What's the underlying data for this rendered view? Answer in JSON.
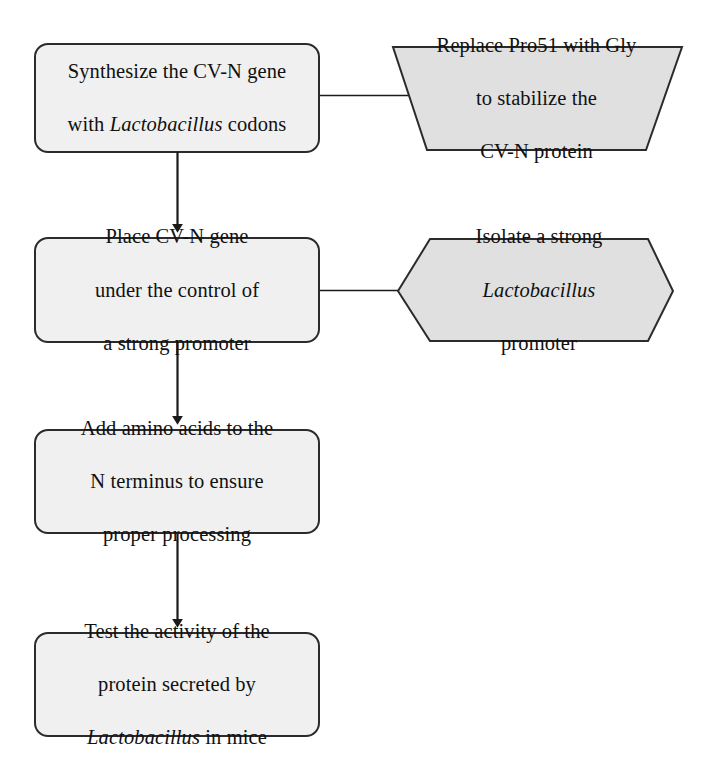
{
  "diagram": {
    "type": "flowchart",
    "orientation": "top-to-bottom",
    "colors": {
      "step_fill": "#f0f0f0",
      "aside_fill": "#e0e0e0",
      "stroke": "#2b2b2b",
      "connector": "#1a1a1a",
      "text": "#111111",
      "background": "#ffffff"
    },
    "steps": [
      {
        "id": "step-1",
        "shape": "rounded-rectangle",
        "lines": [
          "Synthesize the CV-N gene",
          "with Lactobacillus codons"
        ],
        "line1": "Synthesize the CV-N gene",
        "line2_pre": "with ",
        "line2_italic": "Lactobacillus",
        "line2_post": " codons"
      },
      {
        "id": "step-2",
        "shape": "rounded-rectangle",
        "lines": [
          "Place CV-N gene",
          "under the control of",
          "a strong promoter"
        ],
        "line1": "Place CV-N gene",
        "line2": "under the control of",
        "line3": "a strong promoter"
      },
      {
        "id": "step-3",
        "shape": "rounded-rectangle",
        "lines": [
          "Add amino acids to the",
          "N terminus to ensure",
          "proper processing"
        ],
        "line1": "Add amino acids to the",
        "line2": "N terminus to ensure",
        "line3": "proper processing"
      },
      {
        "id": "step-4",
        "shape": "rounded-rectangle",
        "lines": [
          "Test the activity of the",
          "protein secreted by",
          "Lactobacillus in mice"
        ],
        "line1": "Test the activity of the",
        "line2": "protein secreted by",
        "line3_italic": "Lactobacillus",
        "line3_post": " in mice"
      }
    ],
    "asides": [
      {
        "id": "aside-1",
        "shape": "trapezoid",
        "attached_to": "step-1",
        "lines": [
          "Replace Pro51 with Gly",
          "to stabilize the",
          "CV-N protein"
        ],
        "line1": "Replace Pro51 with Gly",
        "line2": "to stabilize the",
        "line3": "CV-N protein"
      },
      {
        "id": "aside-2",
        "shape": "hexagon",
        "attached_to": "step-2",
        "lines": [
          "Isolate a strong",
          "Lactobacillus",
          "promoter"
        ],
        "line1": "Isolate a strong",
        "line2_italic": "Lactobacillus",
        "line3": "promoter"
      }
    ],
    "arrows": [
      {
        "id": "arrow-1-2",
        "from": "step-1",
        "to": "step-2",
        "direction": "down"
      },
      {
        "id": "arrow-2-3",
        "from": "step-2",
        "to": "step-3",
        "direction": "down"
      },
      {
        "id": "arrow-3-4",
        "from": "step-3",
        "to": "step-4",
        "direction": "down"
      }
    ],
    "connectors": [
      {
        "id": "connector-1",
        "from": "step-1",
        "to": "aside-1",
        "direction": "horizontal"
      },
      {
        "id": "connector-2",
        "from": "step-2",
        "to": "aside-2",
        "direction": "horizontal"
      }
    ]
  }
}
